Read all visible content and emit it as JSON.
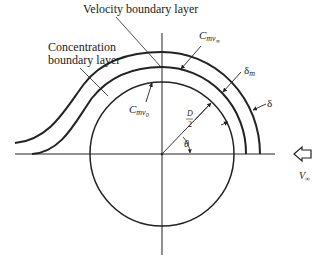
{
  "diagram": {
    "type": "boundary-layer-cylinder",
    "labels": {
      "velocity_boundary_layer": "Velocity boundary layer",
      "concentration_line1": "Concentration",
      "concentration_line2": "boundary layer",
      "c_surface_main": "C",
      "c_surface_sub": "mv",
      "c_surface_subsub": "0",
      "c_free_main": "C",
      "c_free_sub": "mv",
      "c_free_subsub": "∞",
      "delta_m_main": "δ",
      "delta_m_sub": "m",
      "delta": "δ",
      "diameter_num": "D",
      "diameter_den": "2",
      "theta": "θ",
      "v_main": "V",
      "v_sub": "∞"
    },
    "colors": {
      "stroke": "#222222",
      "background": "#ffffff"
    }
  }
}
